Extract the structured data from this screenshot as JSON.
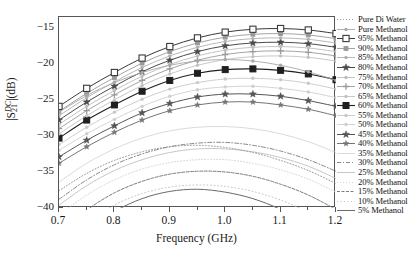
{
  "chart_data": {
    "type": "line",
    "title": "",
    "xlabel": "Frequency (GHz)",
    "ylabel": "|S21DC|(dB)",
    "ylabel_parts": {
      "prefix": "|S",
      "sup": "DC",
      "sub": "21",
      "suffix": "|(dB)"
    },
    "xlim": [
      0.7,
      1.2
    ],
    "ylim": [
      -40,
      -13.5
    ],
    "xticks": [
      "0.7",
      "0.8",
      "0.9",
      "1.0",
      "1.1",
      "1.2"
    ],
    "xtick_values": [
      0.7,
      0.8,
      0.9,
      1.0,
      1.1,
      1.2
    ],
    "yticks": [
      "−15",
      "−20",
      "−25",
      "−30",
      "−35",
      "−40"
    ],
    "ytick_values": [
      -15,
      -20,
      -25,
      -30,
      -35,
      -40
    ],
    "grid": false,
    "legend_position": "right-outside",
    "x": [
      0.7,
      0.75,
      0.8,
      0.85,
      0.9,
      0.95,
      1.0,
      1.05,
      1.1,
      1.15,
      1.2
    ],
    "series": [
      {
        "name": "Pure Di Water",
        "marker": "none",
        "dash": "1,2",
        "color": "#8d8d8d",
        "width": 0.9,
        "values": [
          -37.6,
          -35.2,
          -33.4,
          -32.2,
          -31.5,
          -31.3,
          -31.6,
          -32.3,
          -33.4,
          -34.8,
          -36.6
        ]
      },
      {
        "name": "Pure Methanol",
        "marker": "dot-small",
        "dash": "none",
        "color": "#a8a8a8",
        "width": 0.9,
        "values": [
          -26.7,
          -24.4,
          -22.6,
          -21.2,
          -20.2,
          -19.6,
          -19.4,
          -19.6,
          -20.2,
          -21.1,
          -22.3
        ]
      },
      {
        "name": "95% Methanol",
        "marker": "open-square",
        "dash": "none",
        "color": "#3a3a3a",
        "width": 1.0,
        "values": [
          -25.9,
          -23.4,
          -21.2,
          -19.2,
          -17.6,
          -16.4,
          -15.6,
          -15.2,
          -15.1,
          -15.3,
          -15.8
        ]
      },
      {
        "name": "90% Methanol",
        "marker": "square-small",
        "dash": "none",
        "color": "#9a9a9a",
        "width": 0.9,
        "values": [
          -26.6,
          -24.1,
          -21.9,
          -19.9,
          -18.3,
          -17.1,
          -16.3,
          -15.9,
          -15.8,
          -16.0,
          -16.5
        ]
      },
      {
        "name": "85% Methanol",
        "marker": "dot-small",
        "dash": "none",
        "color": "#b0b0b0",
        "width": 0.9,
        "values": [
          -27.2,
          -24.7,
          -22.5,
          -20.5,
          -18.9,
          -17.7,
          -16.9,
          -16.5,
          -16.4,
          -16.6,
          -17.1
        ]
      },
      {
        "name": "80% Methanol",
        "marker": "star",
        "dash": "none",
        "color": "#4a4a4a",
        "width": 1.0,
        "values": [
          -27.8,
          -25.3,
          -23.1,
          -21.1,
          -19.5,
          -18.3,
          -17.5,
          -17.1,
          -17.0,
          -17.2,
          -17.7
        ]
      },
      {
        "name": "75% Methanol",
        "marker": "dot-small",
        "dash": "none",
        "color": "#bcbcbc",
        "width": 0.9,
        "values": [
          -28.4,
          -25.9,
          -23.7,
          -21.7,
          -20.1,
          -18.9,
          -18.1,
          -17.7,
          -17.6,
          -17.8,
          -18.3
        ]
      },
      {
        "name": "70% Methanol",
        "marker": "plus",
        "dash": "none",
        "color": "#9a9a9a",
        "width": 0.9,
        "values": [
          -29.0,
          -26.5,
          -24.3,
          -22.3,
          -20.7,
          -19.5,
          -18.7,
          -18.3,
          -18.2,
          -18.4,
          -18.9
        ]
      },
      {
        "name": "65% Methanol",
        "marker": "dot-small",
        "dash": "none",
        "color": "#c2c2c2",
        "width": 0.9,
        "values": [
          -29.7,
          -27.2,
          -25.0,
          -23.0,
          -21.4,
          -20.2,
          -19.4,
          -19.0,
          -18.9,
          -19.1,
          -19.6
        ]
      },
      {
        "name": "60% Methanol",
        "marker": "filled-square",
        "dash": "none",
        "color": "#1f1f1f",
        "width": 1.1,
        "values": [
          -30.3,
          -27.8,
          -25.7,
          -23.8,
          -22.3,
          -21.3,
          -20.8,
          -20.7,
          -20.9,
          -21.4,
          -22.2
        ]
      },
      {
        "name": "55% Methanol",
        "marker": "dot-small",
        "dash": "none",
        "color": "#c8c8c8",
        "width": 0.9,
        "values": [
          -31.2,
          -28.8,
          -26.7,
          -24.9,
          -23.5,
          -22.6,
          -22.1,
          -22.0,
          -22.2,
          -22.7,
          -23.5
        ]
      },
      {
        "name": "50% Methanol",
        "marker": "dot-small",
        "dash": "none",
        "color": "#cfcfcf",
        "width": 0.9,
        "values": [
          -32.0,
          -29.7,
          -27.7,
          -25.9,
          -24.5,
          -23.6,
          -23.2,
          -23.1,
          -23.4,
          -23.9,
          -24.7
        ]
      },
      {
        "name": "45% Methanol",
        "marker": "star",
        "dash": "none",
        "color": "#555555",
        "width": 1.0,
        "values": [
          -32.9,
          -30.6,
          -28.6,
          -26.8,
          -25.5,
          -24.6,
          -24.2,
          -24.2,
          -24.5,
          -25.1,
          -25.9
        ]
      },
      {
        "name": "40% Methanol",
        "marker": "star-small",
        "dash": "none",
        "color": "#757575",
        "width": 1.0,
        "values": [
          -33.8,
          -31.5,
          -29.5,
          -27.8,
          -26.5,
          -25.7,
          -25.3,
          -25.3,
          -25.7,
          -26.3,
          -27.2
        ]
      },
      {
        "name": "35% Methanol",
        "marker": "none",
        "dash": "none",
        "color": "#d6d6d6",
        "width": 0.9,
        "values": [
          -36.4,
          -33.8,
          -31.8,
          -30.3,
          -29.3,
          -28.8,
          -28.7,
          -29.0,
          -29.7,
          -30.8,
          -32.3
        ]
      },
      {
        "name": "30% Methanol",
        "marker": "none",
        "dash": "4,2,1,2",
        "color": "#7a7a7a",
        "width": 0.9,
        "values": [
          -38.8,
          -36.1,
          -34.0,
          -32.5,
          -31.5,
          -31.0,
          -30.9,
          -31.3,
          -32.1,
          -33.3,
          -34.9
        ]
      },
      {
        "name": "25% Methanol",
        "marker": "none",
        "dash": "none",
        "color": "#c0c0c0",
        "width": 0.9,
        "values": [
          -39.6,
          -36.9,
          -34.8,
          -33.3,
          -32.3,
          -31.8,
          -31.8,
          -32.2,
          -33.0,
          -34.2,
          -35.9
        ]
      },
      {
        "name": "20% Methanol",
        "marker": "none",
        "dash": "1,2",
        "color": "#d0d0d0",
        "width": 0.9,
        "values": [
          -41.0,
          -38.2,
          -36.1,
          -34.6,
          -33.7,
          -33.3,
          -33.3,
          -33.8,
          -34.7,
          -36.0,
          -37.8
        ]
      },
      {
        "name": "15% Methanol",
        "marker": "none",
        "dash": "3,1.5",
        "color": "#6e6e6e",
        "width": 0.9,
        "values": [
          -43.5,
          -40.3,
          -37.9,
          -36.3,
          -35.3,
          -34.9,
          -35.0,
          -35.6,
          -36.7,
          -38.2,
          -40.2
        ]
      },
      {
        "name": "10% Methanol",
        "marker": "none",
        "dash": "1,2.5",
        "color": "#bdbdbd",
        "width": 0.9,
        "values": [
          -45.2,
          -42.0,
          -39.6,
          -38.0,
          -37.1,
          -36.8,
          -37.0,
          -37.7,
          -38.9,
          -40.6,
          -42.8
        ]
      },
      {
        "name": "5% Methanol",
        "marker": "none",
        "dash": "none",
        "color": "#6a6a6a",
        "width": 1.0,
        "values": [
          -47.0,
          -43.2,
          -40.5,
          -38.7,
          -37.7,
          -37.4,
          -37.8,
          -38.7,
          -40.2,
          -42.3,
          -45.0
        ]
      }
    ]
  }
}
